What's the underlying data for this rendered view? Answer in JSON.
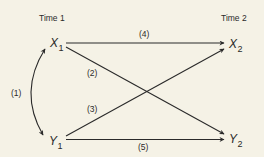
{
  "diagram": {
    "type": "cross-lagged panel diagram",
    "time_labels": {
      "left": "Time 1",
      "right": "Time 2"
    },
    "nodes": {
      "x1": {
        "base": "X",
        "sub": "1"
      },
      "y1": {
        "base": "Y",
        "sub": "1"
      },
      "x2": {
        "base": "X",
        "sub": "2"
      },
      "y2": {
        "base": "Y",
        "sub": "2"
      }
    },
    "paths": [
      {
        "id": "1",
        "label": "(1)",
        "from": "X1",
        "to": "Y1",
        "kind": "bidirectional curved"
      },
      {
        "id": "2",
        "label": "(2)",
        "from": "X1",
        "to": "Y2",
        "kind": "directed"
      },
      {
        "id": "3",
        "label": "(3)",
        "from": "Y1",
        "to": "X2",
        "kind": "directed"
      },
      {
        "id": "4",
        "label": "(4)",
        "from": "X1",
        "to": "X2",
        "kind": "directed"
      },
      {
        "id": "5",
        "label": "(5)",
        "from": "Y1",
        "to": "Y2",
        "kind": "directed"
      }
    ],
    "colors": {
      "background": "#f5f2e6",
      "ink": "#2a2a2a"
    }
  }
}
